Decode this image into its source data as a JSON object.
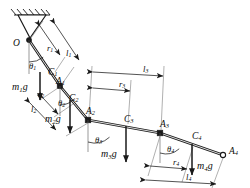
{
  "figure": {
    "type": "mechanical-free-body-diagram",
    "background_color": "#ffffff",
    "ink_color": "#1a1a1a",
    "dimension_color": "#6e6e6e"
  },
  "support": {
    "name": "fixed-pivot-support",
    "hatching": "diagonal",
    "pivot_label": "O"
  },
  "points": [
    {
      "id": "O",
      "label": "O",
      "sub": "",
      "x": 27,
      "y": 40,
      "kind": "pivot"
    },
    {
      "id": "C1",
      "label": "C",
      "sub": "1",
      "x": 53,
      "y": 74,
      "kind": "com"
    },
    {
      "id": "A1",
      "label": "A",
      "sub": "1",
      "x": 60,
      "y": 86,
      "kind": "joint"
    },
    {
      "id": "C2",
      "label": "C",
      "sub": "2",
      "x": 73,
      "y": 102,
      "kind": "com"
    },
    {
      "id": "A2",
      "label": "A",
      "sub": "2",
      "x": 88,
      "y": 120,
      "kind": "joint"
    },
    {
      "id": "C3",
      "label": "C",
      "sub": "3",
      "x": 128,
      "y": 127,
      "kind": "com"
    },
    {
      "id": "A3",
      "label": "A",
      "sub": "3",
      "x": 160,
      "y": 133,
      "kind": "joint"
    },
    {
      "id": "C4",
      "label": "C",
      "sub": "4",
      "x": 193,
      "y": 145,
      "kind": "com"
    },
    {
      "id": "A4",
      "label": "A",
      "sub": "4",
      "x": 223,
      "y": 155,
      "kind": "end"
    }
  ],
  "angles": [
    {
      "id": "theta1",
      "symbol": "θ",
      "sub": "1",
      "label_x": 29,
      "label_y": 67
    },
    {
      "id": "theta2",
      "symbol": "θ",
      "sub": "2",
      "label_x": 58,
      "label_y": 104
    },
    {
      "id": "theta3",
      "symbol": "θ",
      "sub": "3",
      "label_x": 95,
      "label_y": 141
    },
    {
      "id": "theta4",
      "symbol": "θ",
      "sub": "4",
      "label_x": 167,
      "label_y": 150
    }
  ],
  "forces": [
    {
      "id": "m1g",
      "symbol": "m",
      "sub": "1",
      "tail": "g",
      "label_x": 23,
      "label_y": 88,
      "ax": 40,
      "ay": 72,
      "ay2": 100
    },
    {
      "id": "m2g",
      "symbol": "m",
      "sub": "2",
      "tail": "g",
      "label_x": 57,
      "label_y": 120,
      "ax": 70,
      "ay": 100,
      "ay2": 133
    },
    {
      "id": "m3g",
      "symbol": "m",
      "sub": "3",
      "tail": "g",
      "label_x": 114,
      "label_y": 155,
      "ax": 126,
      "ay": 126,
      "ay2": 162
    },
    {
      "id": "m4g",
      "symbol": "m",
      "sub": "4",
      "tail": "g",
      "label_x": 198,
      "label_y": 167,
      "ax": 192,
      "ay": 144,
      "ay2": 175
    }
  ],
  "dimensions": [
    {
      "id": "r1",
      "symbol": "r",
      "sub": "1",
      "label_x": 47,
      "label_y": 49
    },
    {
      "id": "l1",
      "symbol": "l",
      "sub": "1",
      "label_x": 66,
      "label_y": 54
    },
    {
      "id": "r2",
      "symbol": "r",
      "sub": "2",
      "label_x": 38,
      "label_y": 95
    },
    {
      "id": "l2",
      "symbol": "l",
      "sub": "2",
      "label_x": 31,
      "label_y": 110
    },
    {
      "id": "r3",
      "symbol": "r",
      "sub": "3",
      "label_x": 119,
      "label_y": 85
    },
    {
      "id": "l3",
      "symbol": "l",
      "sub": "3",
      "label_x": 143,
      "label_y": 70
    },
    {
      "id": "r4",
      "symbol": "r",
      "sub": "4",
      "label_x": 173,
      "label_y": 163
    },
    {
      "id": "l4",
      "symbol": "l",
      "sub": "4",
      "label_x": 186,
      "label_y": 178
    }
  ],
  "links": [
    {
      "id": "link1",
      "from": "O",
      "to": "A1",
      "com": "C1",
      "length_dim": "l1",
      "com_dim": "r1",
      "angle": "theta1",
      "weight": "m1g"
    },
    {
      "id": "link2",
      "from": "A1",
      "to": "A2",
      "com": "C2",
      "length_dim": "l2",
      "com_dim": "r2",
      "angle": "theta2",
      "weight": "m2g"
    },
    {
      "id": "link3",
      "from": "A2",
      "to": "A3",
      "com": "C3",
      "length_dim": "l3",
      "com_dim": "r3",
      "angle": "theta3",
      "weight": "m3g"
    },
    {
      "id": "link4",
      "from": "A3",
      "to": "A4",
      "com": "C4",
      "length_dim": "l4",
      "com_dim": "r4",
      "angle": "theta4",
      "weight": "m4g"
    }
  ]
}
